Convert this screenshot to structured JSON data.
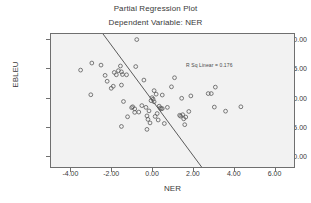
{
  "chart_data": {
    "type": "scatter",
    "title": "Partial Regression Plot",
    "subtitle": "Dependent Variable: NER",
    "xlabel": "NER",
    "ylabel": "EBLEU",
    "xlim": [
      -5.0,
      7.0
    ],
    "ylim": [
      -12.0,
      11.0
    ],
    "grid": false,
    "legend": "none",
    "xticks": [
      "-4.00",
      "-2.00",
      "0.00",
      "2.00",
      "4.00",
      "6.00"
    ],
    "xtick_values": [
      -4.0,
      -2.0,
      0.0,
      2.0,
      4.0,
      6.0
    ],
    "yticks": [
      "10.00",
      "5.00",
      "0.00",
      "-5.00",
      "-10.00"
    ],
    "ytick_values": [
      10.0,
      5.0,
      0.0,
      -5.0,
      -10.0
    ],
    "annotation": "R Sq Linear = 0.176",
    "r_sq_linear": 0.176,
    "fit_line": {
      "x": [
        -2.45,
        2.45
      ],
      "y": [
        11.0,
        -12.0
      ]
    },
    "points": [
      [
        -3.55,
        4.85
      ],
      [
        -3.0,
        6.05
      ],
      [
        -3.05,
        0.65
      ],
      [
        -2.55,
        5.7
      ],
      [
        -2.35,
        3.95
      ],
      [
        -2.25,
        2.95
      ],
      [
        -2.05,
        1.75
      ],
      [
        -1.95,
        2.1
      ],
      [
        -1.9,
        4.45
      ],
      [
        -1.8,
        4.05
      ],
      [
        -1.7,
        4.75
      ],
      [
        -1.6,
        5.55
      ],
      [
        -1.55,
        2.3
      ],
      [
        -1.55,
        4.55
      ],
      [
        -1.5,
        4.1
      ],
      [
        -1.45,
        -0.5
      ],
      [
        -1.55,
        -4.75
      ],
      [
        -1.3,
        4.05
      ],
      [
        -1.25,
        -3.1
      ],
      [
        -1.05,
        -1.55
      ],
      [
        -1.0,
        -1.4
      ],
      [
        -0.9,
        -1.75
      ],
      [
        -0.85,
        5.45
      ],
      [
        -0.8,
        10.05
      ],
      [
        -0.9,
        -2.35
      ],
      [
        -0.7,
        -2.3
      ],
      [
        -0.55,
        -1.2
      ],
      [
        -0.45,
        3.15
      ],
      [
        -0.35,
        -1.5
      ],
      [
        -0.3,
        -5.25
      ],
      [
        -0.3,
        -2.95
      ],
      [
        -0.25,
        -3.55
      ],
      [
        -0.2,
        -2.1
      ],
      [
        -0.15,
        -4.15
      ],
      [
        -0.1,
        -0.35
      ],
      [
        -0.05,
        0.15
      ],
      [
        0.0,
        -0.1
      ],
      [
        0.05,
        -0.55
      ],
      [
        0.05,
        1.35
      ],
      [
        0.1,
        -3.05
      ],
      [
        0.15,
        0.75
      ],
      [
        0.2,
        -2.55
      ],
      [
        0.25,
        -3.65
      ],
      [
        0.3,
        -1.3
      ],
      [
        0.35,
        -1.6
      ],
      [
        0.4,
        -1.75
      ],
      [
        0.45,
        -1.7
      ],
      [
        0.45,
        0.6
      ],
      [
        0.55,
        -4.25
      ],
      [
        0.7,
        -1.5
      ],
      [
        0.9,
        2.0
      ],
      [
        1.05,
        3.55
      ],
      [
        1.3,
        -2.85
      ],
      [
        1.35,
        -3.0
      ],
      [
        1.4,
        0.05
      ],
      [
        1.45,
        -2.75
      ],
      [
        1.5,
        -3.45
      ],
      [
        1.55,
        -4.45
      ],
      [
        1.6,
        -3.15
      ],
      [
        1.75,
        -2.2
      ],
      [
        1.85,
        0.45
      ],
      [
        2.7,
        0.85
      ],
      [
        2.85,
        0.85
      ],
      [
        3.05,
        1.95
      ],
      [
        3.0,
        -1.45
      ],
      [
        3.55,
        -2.15
      ],
      [
        4.3,
        -1.4
      ]
    ]
  }
}
